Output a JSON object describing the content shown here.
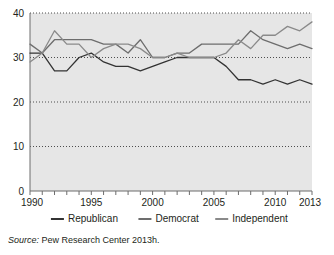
{
  "chart_data": {
    "type": "line",
    "title": "",
    "xlabel": "",
    "ylabel": "",
    "xlim": [
      1990,
      2013
    ],
    "ylim": [
      0,
      40
    ],
    "grid": true,
    "grid_style": "dotted-horizontal",
    "legend_position": "bottom",
    "y_ticks": [
      0,
      10,
      20,
      30,
      40
    ],
    "y_tick_labels": [
      "0",
      "10",
      "20",
      "30",
      "40"
    ],
    "x_ticks": [
      1990,
      1991,
      1992,
      1993,
      1994,
      1995,
      1996,
      1997,
      1998,
      1999,
      2000,
      2001,
      2002,
      2003,
      2004,
      2005,
      2006,
      2007,
      2008,
      2009,
      2010,
      2011,
      2012,
      2013
    ],
    "x_tick_labels": [
      "1990",
      "1995",
      "2000",
      "2005",
      "2010",
      "2013"
    ],
    "x_labeled_ticks": [
      1990,
      1995,
      2000,
      2005,
      2010,
      2013
    ],
    "x": [
      1990,
      1991,
      1992,
      1993,
      1994,
      1995,
      1996,
      1997,
      1998,
      1999,
      2000,
      2001,
      2002,
      2003,
      2004,
      2005,
      2006,
      2007,
      2008,
      2009,
      2010,
      2011,
      2012,
      2013
    ],
    "series": [
      {
        "name": "Republican",
        "color": "#333333",
        "values": [
          31,
          31,
          27,
          27,
          30,
          31,
          29,
          28,
          28,
          27,
          28,
          29,
          30,
          30,
          30,
          30,
          28,
          25,
          25,
          24,
          25,
          24,
          25,
          24
        ]
      },
      {
        "name": "Democrat",
        "color": "#6d6d6d",
        "values": [
          33,
          31,
          34,
          34,
          34,
          34,
          33,
          33,
          31,
          34,
          30,
          30,
          31,
          31,
          33,
          33,
          33,
          33,
          36,
          34,
          33,
          32,
          33,
          32
        ]
      },
      {
        "name": "Independent",
        "color": "#8a8a8a",
        "values": [
          29,
          31,
          36,
          33,
          33,
          30,
          32,
          33,
          33,
          32,
          30,
          30,
          31,
          30,
          30,
          30,
          31,
          34,
          32,
          35,
          35,
          37,
          36,
          38
        ]
      }
    ],
    "legend": [
      "Republican",
      "Democrat",
      "Independent"
    ]
  },
  "source": {
    "lead": "Source:",
    "text": " Pew Research Center 2013h."
  },
  "style": {
    "plot_background": "#e6e6e6",
    "grid_color": "#4d4d4d",
    "axis_color": "#6d6d6d",
    "text_color": "#231f20"
  }
}
